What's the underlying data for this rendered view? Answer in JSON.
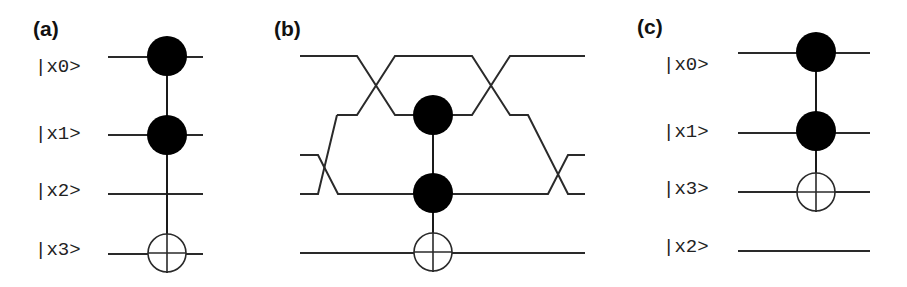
{
  "figure": {
    "width": 907,
    "height": 287,
    "colors": {
      "wire": "#2a2a2a",
      "control": "#000000",
      "background": "#ffffff"
    },
    "panels": [
      {
        "id": "a",
        "label": "(a)",
        "label_pos": [
          33,
          36
        ],
        "qubits": [
          {
            "label": "|x0>",
            "label_x": 35,
            "label_y": 72,
            "wire_y": 57,
            "x1": 108,
            "x2": 203
          },
          {
            "label": "|x1>",
            "label_x": 35,
            "label_y": 139,
            "wire_y": 135,
            "x1": 108,
            "x2": 203
          },
          {
            "label": "|x2>",
            "label_x": 35,
            "label_y": 196,
            "wire_y": 194,
            "x1": 108,
            "x2": 203
          },
          {
            "label": "|x3>",
            "label_x": 35,
            "label_y": 255,
            "wire_y": 254,
            "x1": 108,
            "x2": 203
          }
        ],
        "gate": {
          "type": "Toffoli",
          "x": 167,
          "controls_y": [
            56,
            135
          ],
          "target_y": 253,
          "line_top": 40,
          "line_bottom": 273
        }
      },
      {
        "id": "b",
        "label": "(b)",
        "label_pos": [
          274,
          36
        ],
        "paths": [
          [
            [
              300,
              56
            ],
            [
              357,
              56
            ],
            [
              395,
              115
            ],
            [
              432,
              115
            ]
          ],
          [
            [
              337,
              115
            ],
            [
              357,
              115
            ],
            [
              395,
              56
            ],
            [
              472,
              56
            ],
            [
              510,
              115
            ],
            [
              528,
              115
            ],
            [
              568,
              194
            ],
            [
              585,
              194
            ]
          ],
          [
            [
              300,
              155
            ],
            [
              318,
              155
            ],
            [
              338,
              194
            ],
            [
              548,
              194
            ],
            [
              568,
              155
            ],
            [
              585,
              155
            ]
          ],
          [
            [
              300,
              194
            ],
            [
              318,
              194
            ],
            [
              337,
              115
            ]
          ],
          [
            [
              432,
              115
            ],
            [
              472,
              115
            ],
            [
              510,
              56
            ],
            [
              585,
              56
            ]
          ],
          [
            [
              300,
              253
            ],
            [
              585,
              253
            ]
          ]
        ],
        "gate": {
          "type": "Toffoli",
          "x": 433,
          "controls_y": [
            115,
            193
          ],
          "target_y": 252,
          "line_top": 115,
          "line_bottom": 272
        },
        "swaps": [
          {
            "between": [
              "wire 1",
              "wire 2"
            ],
            "position": "left",
            "x": 376
          },
          {
            "between": [
              "wire 3",
              "wire 4"
            ],
            "position": "left",
            "x": 328
          },
          {
            "between": [
              "wire 1",
              "wire 2"
            ],
            "position": "right",
            "x": 491
          },
          {
            "between": [
              "wire 3",
              "wire 4"
            ],
            "position": "right",
            "x": 558
          }
        ]
      },
      {
        "id": "c",
        "label": "(c)",
        "label_pos": [
          637,
          34
        ],
        "qubits": [
          {
            "label": "|x0>",
            "label_x": 663,
            "label_y": 70,
            "wire_y": 53,
            "x1": 738,
            "x2": 870
          },
          {
            "label": "|x1>",
            "label_x": 663,
            "label_y": 137,
            "wire_y": 133,
            "x1": 738,
            "x2": 870
          },
          {
            "label": "|x3>",
            "label_x": 663,
            "label_y": 194,
            "wire_y": 192,
            "x1": 738,
            "x2": 870
          },
          {
            "label": "|x2>",
            "label_x": 663,
            "label_y": 252,
            "wire_y": 251,
            "x1": 738,
            "x2": 870
          }
        ],
        "gate": {
          "type": "Toffoli",
          "x": 816,
          "controls_y": [
            52,
            131
          ],
          "target_y": 192,
          "line_top": 36,
          "line_bottom": 212
        }
      }
    ]
  }
}
